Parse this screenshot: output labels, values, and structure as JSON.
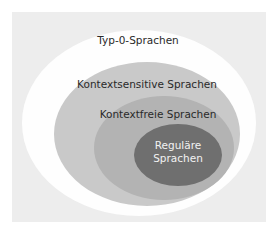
{
  "diagram": {
    "type": "nested-sets (Chomsky hierarchy)",
    "sets": [
      {
        "label": "Typ-0-Sprachen",
        "color": "#fefefe"
      },
      {
        "label": "Kontextsensitive Sprachen",
        "color": "#c9c9c9"
      },
      {
        "label": "Kontextfreie Sprachen",
        "color": "#b3b3b3"
      },
      {
        "label_line1": "Reguläre",
        "label_line2": "Sprachen",
        "color": "#6f6f6f"
      }
    ],
    "background": "#ededed"
  }
}
